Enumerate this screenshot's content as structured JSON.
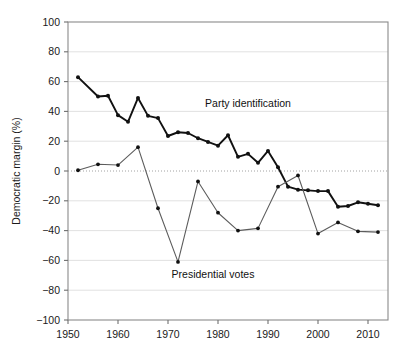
{
  "chart_data": {
    "type": "line",
    "title": "",
    "xlabel": "",
    "ylabel": "Democratic margin (%)",
    "xlim": [
      1950,
      2014
    ],
    "ylim": [
      -100,
      100
    ],
    "grid": true,
    "legend_position": "inline-annotations",
    "xticks": [
      1950,
      1960,
      1970,
      1980,
      1990,
      2000,
      2010
    ],
    "xtick_labels": [
      "1950",
      "1960",
      "1970",
      "1980",
      "1990",
      "2000",
      "2010"
    ],
    "yticks": [
      -100,
      -80,
      -60,
      -40,
      -20,
      0,
      20,
      40,
      60,
      80,
      100
    ],
    "ytick_labels": [
      "−100",
      "−80",
      "−60",
      "−40",
      "−20",
      "0",
      "20",
      "40",
      "60",
      "80",
      "100"
    ],
    "annotations": [
      {
        "text": "Party identification",
        "x": 1986,
        "y": 43
      },
      {
        "text": "Presidential votes",
        "x": 1979,
        "y": -72
      }
    ],
    "series": [
      {
        "name": "Party identification",
        "color": "#111111",
        "line_width": 1.9,
        "marker": "circle",
        "x": [
          1952,
          1956,
          1958,
          1960,
          1962,
          1964,
          1966,
          1968,
          1970,
          1972,
          1974,
          1976,
          1978,
          1980,
          1982,
          1984,
          1986,
          1988,
          1990,
          1992,
          1994,
          1996,
          1998,
          2000,
          2002,
          2004,
          2006,
          2008,
          2010,
          2012
        ],
        "y": [
          63,
          50,
          50.5,
          37.5,
          33,
          49,
          37,
          35.5,
          23.5,
          26,
          25.5,
          22,
          19.5,
          17,
          24,
          9.5,
          11.5,
          5.5,
          13.5,
          2.5,
          -10.5,
          -12.5,
          -13,
          -13.5,
          -13.5,
          -24,
          -23.5,
          -21,
          -22,
          -23
        ]
      },
      {
        "name": "Presidential votes",
        "color": "#5c5c5c",
        "line_width": 1.1,
        "marker": "circle",
        "x": [
          1952,
          1956,
          1960,
          1964,
          1968,
          1972,
          1976,
          1980,
          1984,
          1988,
          1992,
          1996,
          2000,
          2004,
          2008,
          2012
        ],
        "y": [
          0.5,
          4.5,
          4,
          16,
          -25,
          -61,
          -7,
          -28,
          -40,
          -38.5,
          -10.5,
          -3,
          -42,
          -34.5,
          -40.5,
          -41
        ]
      }
    ]
  },
  "caption": {
    "partial_text": ""
  }
}
